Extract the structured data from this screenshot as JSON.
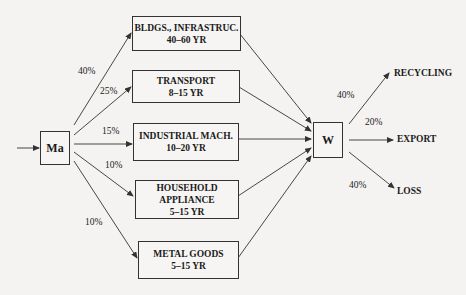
{
  "diagram": {
    "source_node": {
      "label": "Ma"
    },
    "waste_node": {
      "label": "W"
    },
    "sectors": [
      {
        "name": "BLDGS., INFRASTRUC.",
        "lifetime": "40–60 YR",
        "share": "40%"
      },
      {
        "name": "TRANSPORT",
        "lifetime": "8–15 YR",
        "share": "25%"
      },
      {
        "name": "INDUSTRIAL MACH.",
        "lifetime": "10–20 YR",
        "share": "15%"
      },
      {
        "name_line1": "HOUSEHOLD",
        "name_line2": "APPLIANCE",
        "lifetime": "5–15 YR",
        "share": "10%"
      },
      {
        "name": "METAL GOODS",
        "lifetime": "5–15 YR",
        "share": "10%"
      }
    ],
    "outputs": [
      {
        "label": "RECYCLING",
        "share": "40%"
      },
      {
        "label": "EXPORT",
        "share": "20%"
      },
      {
        "label": "LOSS",
        "share": "40%"
      }
    ],
    "colors": {
      "line": "#333333",
      "background": "#f4f3f1"
    }
  }
}
